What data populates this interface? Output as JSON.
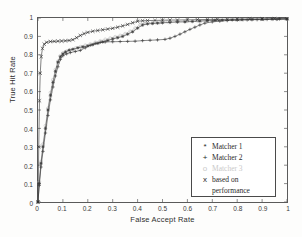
{
  "chart_data": {
    "type": "line",
    "title": "",
    "xlabel": "False Accept Rate",
    "ylabel": "True Hit Rate",
    "xlim": [
      0,
      1
    ],
    "ylim": [
      0,
      1
    ],
    "xticks": [
      "0",
      "0.1",
      "0.2",
      "0.3",
      "0.4",
      "0.5",
      "0.6",
      "0.7",
      "0.8",
      "0.9",
      "1"
    ],
    "yticks": [
      "0",
      "0.1",
      "0.2",
      "0.3",
      "0.4",
      "0.5",
      "0.6",
      "0.7",
      "0.8",
      "0.9",
      "1"
    ],
    "grid": false,
    "legend_position": "lower-right",
    "series": [
      {
        "name": "Matcher 1",
        "marker": "*",
        "color": "#3a3a3a",
        "x": [
          0,
          0.005,
          0.012,
          0.02,
          0.03,
          0.04,
          0.05,
          0.06,
          0.07,
          0.08,
          0.09,
          0.1,
          0.11,
          0.125,
          0.14,
          0.16,
          0.18,
          0.2,
          0.22,
          0.24,
          0.26,
          0.28,
          0.3,
          0.32,
          0.34,
          0.36,
          0.38,
          0.4,
          0.42,
          0.44,
          0.46,
          0.48,
          0.5,
          0.53,
          0.56,
          0.59,
          0.62,
          0.65,
          0.68,
          0.71,
          0.74,
          0.78,
          0.82,
          0.86,
          0.9,
          0.94,
          0.97,
          1.0
        ],
        "y": [
          0,
          0.1,
          0.21,
          0.3,
          0.4,
          0.5,
          0.58,
          0.65,
          0.71,
          0.76,
          0.79,
          0.805,
          0.815,
          0.825,
          0.83,
          0.838,
          0.843,
          0.848,
          0.855,
          0.862,
          0.87,
          0.878,
          0.886,
          0.893,
          0.9,
          0.912,
          0.925,
          0.945,
          0.962,
          0.968,
          0.97,
          0.972,
          0.974,
          0.976,
          0.978,
          0.979,
          0.981,
          0.983,
          0.985,
          0.987,
          0.988,
          0.99,
          0.991,
          0.992,
          0.993,
          0.994,
          0.995,
          0.995
        ]
      },
      {
        "name": "Matcher 2",
        "marker": "+",
        "color": "#3a3a3a",
        "x": [
          0,
          0.005,
          0.012,
          0.02,
          0.03,
          0.04,
          0.05,
          0.06,
          0.07,
          0.08,
          0.09,
          0.1,
          0.115,
          0.13,
          0.15,
          0.17,
          0.19,
          0.21,
          0.23,
          0.25,
          0.27,
          0.3,
          0.33,
          0.36,
          0.39,
          0.42,
          0.45,
          0.48,
          0.51,
          0.53,
          0.55,
          0.57,
          0.59,
          0.61,
          0.63,
          0.65,
          0.67,
          0.7,
          0.73,
          0.76,
          0.8,
          0.84,
          0.88,
          0.92,
          0.96,
          1.0
        ],
        "y": [
          0,
          0.09,
          0.19,
          0.275,
          0.375,
          0.47,
          0.555,
          0.625,
          0.685,
          0.735,
          0.775,
          0.795,
          0.805,
          0.812,
          0.818,
          0.824,
          0.838,
          0.852,
          0.862,
          0.868,
          0.87,
          0.871,
          0.872,
          0.873,
          0.874,
          0.877,
          0.879,
          0.881,
          0.884,
          0.89,
          0.9,
          0.912,
          0.925,
          0.938,
          0.95,
          0.962,
          0.972,
          0.979,
          0.983,
          0.986,
          0.988,
          0.99,
          0.991,
          0.992,
          0.993,
          0.994
        ]
      },
      {
        "name": "Matcher 3",
        "marker": "o",
        "color": "#c2c2c2",
        "x": [
          0,
          0.005,
          0.012,
          0.02,
          0.03,
          0.04,
          0.05,
          0.06,
          0.07,
          0.08,
          0.09,
          0.1,
          0.115,
          0.13,
          0.15,
          0.17,
          0.19,
          0.21,
          0.23,
          0.25,
          0.27,
          0.29,
          0.31,
          0.33,
          0.35,
          0.37,
          0.39,
          0.41,
          0.43,
          0.46,
          0.49,
          0.52,
          0.56,
          0.6,
          0.64,
          0.68,
          0.72,
          0.76,
          0.81,
          0.86,
          0.91,
          0.96,
          1.0
        ],
        "y": [
          0,
          0.11,
          0.22,
          0.315,
          0.415,
          0.51,
          0.595,
          0.665,
          0.72,
          0.765,
          0.795,
          0.81,
          0.82,
          0.828,
          0.836,
          0.844,
          0.852,
          0.859,
          0.868,
          0.876,
          0.884,
          0.891,
          0.898,
          0.905,
          0.915,
          0.928,
          0.945,
          0.962,
          0.972,
          0.975,
          0.977,
          0.979,
          0.981,
          0.983,
          0.985,
          0.987,
          0.989,
          0.99,
          0.991,
          0.992,
          0.993,
          0.994,
          0.995
        ]
      },
      {
        "name": "based on performance",
        "marker": "x",
        "color": "#2e2e2e",
        "x": [
          0,
          0.003,
          0.006,
          0.009,
          0.013,
          0.018,
          0.025,
          0.035,
          0.05,
          0.065,
          0.08,
          0.095,
          0.11,
          0.125,
          0.14,
          0.155,
          0.17,
          0.185,
          0.2,
          0.22,
          0.24,
          0.26,
          0.28,
          0.3,
          0.32,
          0.34,
          0.36,
          0.38,
          0.4,
          0.42,
          0.44,
          0.47,
          0.5,
          0.53,
          0.56,
          0.6,
          0.64,
          0.68,
          0.72,
          0.76,
          0.8,
          0.85,
          0.9,
          0.95,
          1.0
        ],
        "y": [
          0,
          0.3,
          0.55,
          0.7,
          0.79,
          0.835,
          0.858,
          0.868,
          0.872,
          0.873,
          0.874,
          0.875,
          0.876,
          0.878,
          0.882,
          0.893,
          0.905,
          0.915,
          0.922,
          0.928,
          0.932,
          0.936,
          0.94,
          0.944,
          0.95,
          0.957,
          0.965,
          0.974,
          0.982,
          0.985,
          0.986,
          0.987,
          0.988,
          0.989,
          0.989,
          0.99,
          0.991,
          0.992,
          0.993,
          0.993,
          0.994,
          0.995,
          0.995,
          0.996,
          0.996
        ]
      }
    ]
  },
  "legend": {
    "entries": [
      {
        "marker": "*",
        "label": "Matcher 1",
        "faded": false
      },
      {
        "marker": "+",
        "label": "Matcher 2",
        "faded": false
      },
      {
        "marker": "o",
        "label": "Matcher 3",
        "faded": true
      },
      {
        "marker": "x",
        "label": "based on",
        "label2": "performance",
        "faded": false
      }
    ]
  }
}
